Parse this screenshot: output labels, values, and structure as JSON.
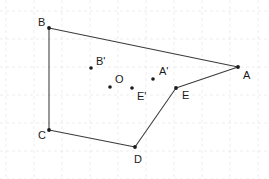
{
  "figure": {
    "width": 269,
    "height": 179,
    "background_color": "#ffffff",
    "line_color": "#3a3a3a",
    "point_color": "#1c1c1c",
    "label_color": "#1a1a1a",
    "grid": {
      "visible": true,
      "color": "#d8d8e4",
      "style": "dashed",
      "x_spacing": 28,
      "y_spacing": 28,
      "x_offset": 6,
      "y_offset": 11
    },
    "vertices": [
      {
        "label": "B",
        "x": 49,
        "y": 28,
        "label_x": 38,
        "label_y": 23
      },
      {
        "label": "A",
        "x": 238,
        "y": 67,
        "label_x": 243,
        "label_y": 76
      },
      {
        "label": "E",
        "x": 176,
        "y": 88,
        "label_x": 182,
        "label_y": 96
      },
      {
        "label": "D",
        "x": 135,
        "y": 147,
        "label_x": 134,
        "label_y": 160
      },
      {
        "label": "C",
        "x": 49,
        "y": 130,
        "label_x": 38,
        "label_y": 136
      }
    ],
    "edges": [
      {
        "name": "edge-B-A",
        "from": "B",
        "to": "A"
      },
      {
        "name": "edge-A-E",
        "from": "A",
        "to": "E"
      },
      {
        "name": "edge-E-D",
        "from": "E",
        "to": "D"
      },
      {
        "name": "edge-D-C",
        "from": "D",
        "to": "C"
      },
      {
        "name": "edge-C-B",
        "from": "C",
        "to": "B"
      }
    ],
    "interior_points": [
      {
        "label": "B'",
        "x": 91,
        "y": 68,
        "label_x": 96,
        "label_y": 62
      },
      {
        "label": "O",
        "x": 110,
        "y": 87,
        "label_x": 115,
        "label_y": 80
      },
      {
        "label": "E'",
        "x": 132,
        "y": 88,
        "label_x": 137,
        "label_y": 97
      },
      {
        "label": "A'",
        "x": 153,
        "y": 79,
        "label_x": 159,
        "label_y": 72
      }
    ]
  }
}
